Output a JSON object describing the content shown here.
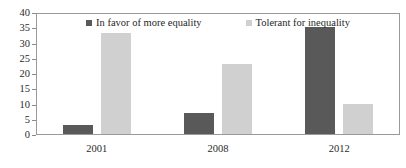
{
  "chart_data": {
    "type": "bar",
    "title": "",
    "subtitle": "",
    "xlabel": "",
    "ylabel": "",
    "categories": [
      "2001",
      "2008",
      "2012"
    ],
    "series": [
      {
        "name": "In favor of more equality",
        "color": "#595959",
        "values": [
          3,
          7,
          35
        ]
      },
      {
        "name": "Tolerant for inequality",
        "color": "#d0d0d0",
        "values": [
          33,
          23,
          10
        ]
      }
    ],
    "ylim": [
      0,
      40
    ],
    "ytick_step": 5,
    "yticks": [
      "40",
      "35",
      "30",
      "25",
      "20",
      "15",
      "10",
      "5",
      "0"
    ],
    "grid": false,
    "legend_position": "top-inside",
    "frame": true
  },
  "axes": {
    "y_tick_labels": [
      "40",
      "35",
      "30",
      "25",
      "20",
      "15",
      "10",
      "5",
      "0"
    ],
    "x_tick_labels": [
      "2001",
      "2008",
      "2012"
    ]
  },
  "legend": {
    "entries": [
      {
        "label": "In favor of more equality",
        "swatch_color": "#595959"
      },
      {
        "label": "Tolerant for inequality",
        "swatch_color": "#d0d0d0"
      }
    ]
  },
  "colors": {
    "series_dark": "#595959",
    "series_light": "#d0d0d0",
    "frame": "#9a9a9a",
    "text": "#2b2b2b",
    "background": "#ffffff"
  }
}
